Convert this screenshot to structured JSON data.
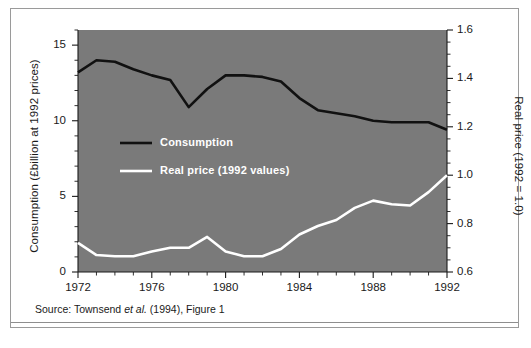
{
  "figure": {
    "source_note_prefix": "Source: Townsend ",
    "source_note_italic": "et al.",
    "source_note_suffix": " (1994), Figure 1",
    "plot_background": "#7a7a7a",
    "page_background": "#ffffff",
    "frame_color": "#9a9a9a"
  },
  "chart_data": {
    "type": "line",
    "title": "",
    "subtitle": "",
    "xlabel": "",
    "ylabel": "Consumption (£billion at 1992 prices)",
    "y2label": "Real price (1992 = 1.0)",
    "grid": false,
    "legend_position": "inside-left",
    "xlim": [
      1972,
      1992
    ],
    "ylim": [
      0,
      16
    ],
    "y2lim": [
      0.6,
      1.6
    ],
    "xticks": [
      1972,
      1976,
      1980,
      1984,
      1988,
      1992
    ],
    "xtick_labels": [
      "1972",
      "1976",
      "1980",
      "1984",
      "1988",
      "1992"
    ],
    "xminor_step": 1,
    "yticks": [
      0,
      5,
      10,
      15
    ],
    "ytick_labels": [
      "0",
      "5",
      "10",
      "15"
    ],
    "yminor_step": 1,
    "y2ticks": [
      0.6,
      0.8,
      1.0,
      1.2,
      1.4,
      1.6
    ],
    "y2tick_labels": [
      "0.6",
      "0.8",
      "1.0",
      "1.2",
      "1.4",
      "1.6"
    ],
    "y2minor_step": 0.05,
    "x": [
      1972,
      1973,
      1974,
      1975,
      1976,
      1977,
      1978,
      1979,
      1980,
      1981,
      1982,
      1983,
      1984,
      1985,
      1986,
      1987,
      1988,
      1989,
      1990,
      1991,
      1992
    ],
    "series": [
      {
        "name": "Consumption",
        "axis": "left",
        "color": "#111111",
        "width": 2.6,
        "values": [
          13.2,
          14.0,
          13.9,
          13.4,
          13.0,
          12.7,
          10.9,
          12.1,
          13.0,
          13.0,
          12.9,
          12.6,
          11.5,
          10.7,
          10.5,
          10.3,
          10.0,
          9.9,
          9.9,
          9.9,
          9.4
        ]
      },
      {
        "name": "Real price (1992 values)",
        "axis": "right",
        "color": "#ffffff",
        "width": 2.6,
        "values": [
          0.72,
          0.67,
          0.665,
          0.665,
          0.685,
          0.7,
          0.7,
          0.745,
          0.685,
          0.665,
          0.665,
          0.695,
          0.755,
          0.79,
          0.815,
          0.865,
          0.895,
          0.88,
          0.875,
          0.93,
          1.0
        ]
      }
    ],
    "legend": [
      {
        "label": "Consumption",
        "color": "#111111"
      },
      {
        "label": "Real price (1992 values)",
        "color": "#ffffff"
      }
    ]
  }
}
